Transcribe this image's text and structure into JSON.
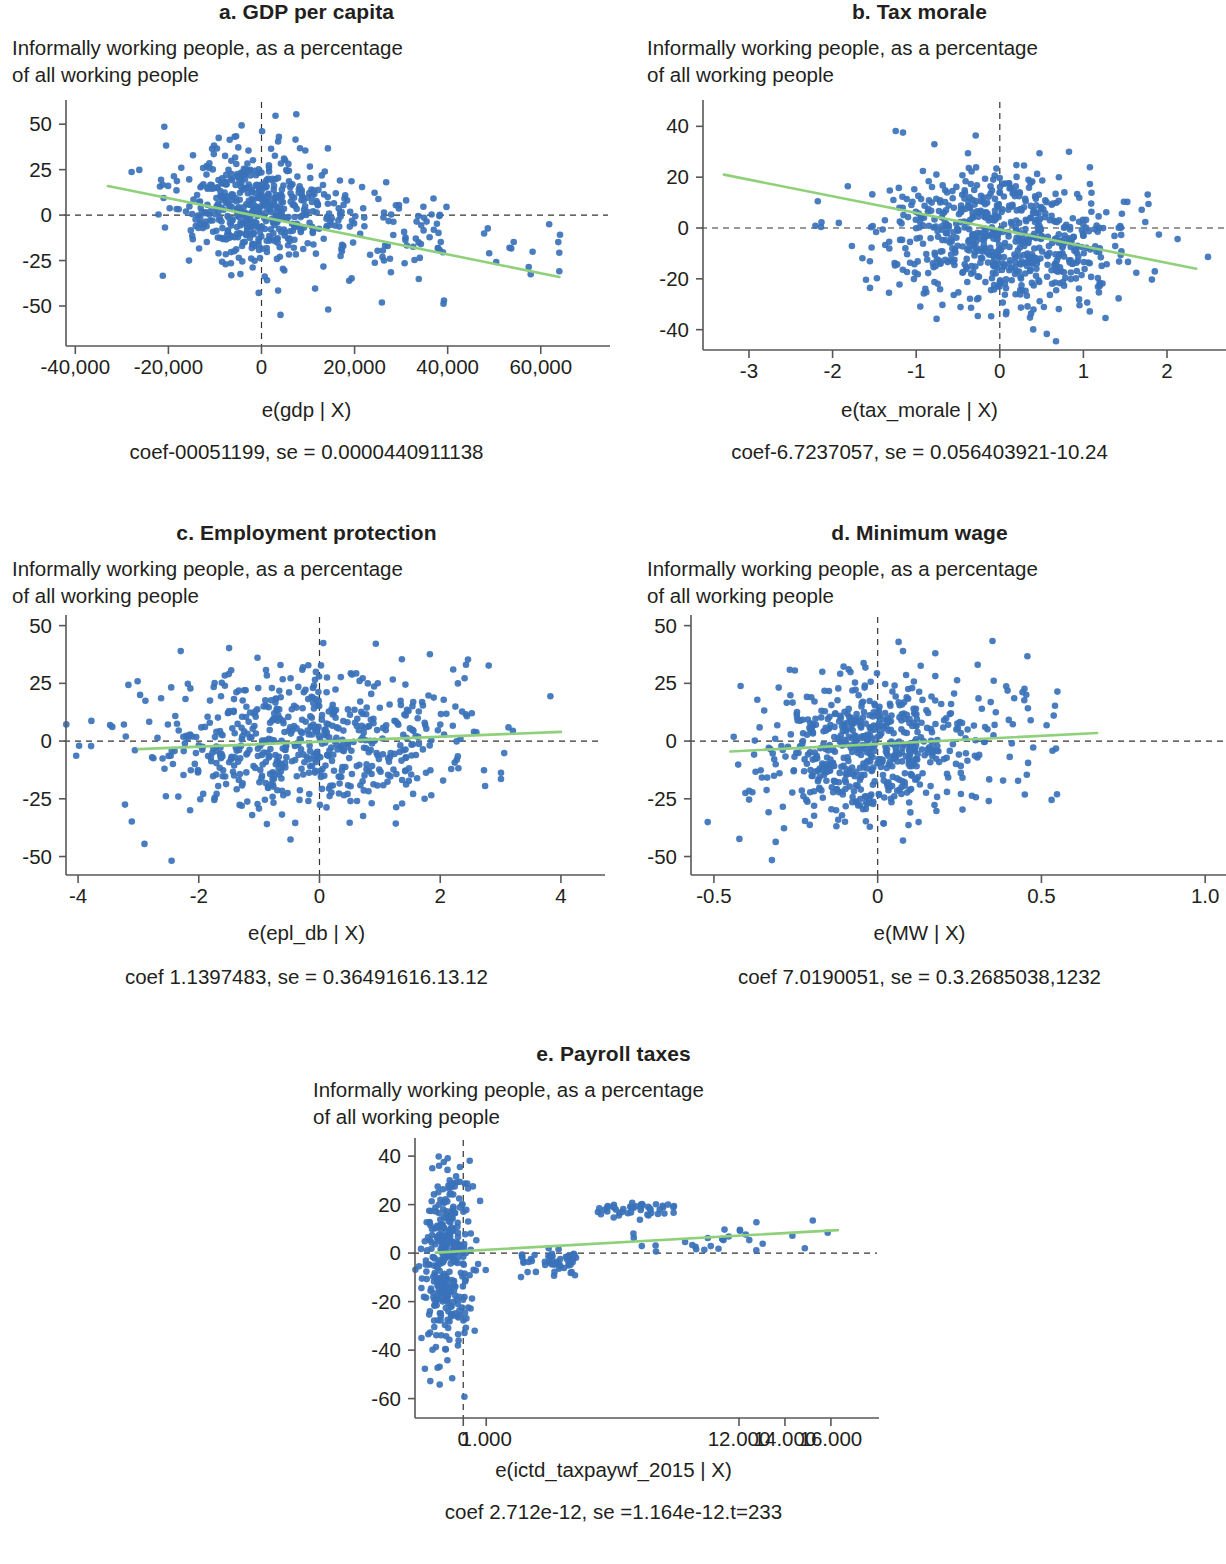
{
  "figure": {
    "subtitle_line1": "Informally working people, as a percentage",
    "subtitle_line2": "of all working people",
    "colors": {
      "point": "#3a72ba",
      "fit_line": "#8fd17a",
      "axis": "#595757",
      "text": "#231f20"
    }
  },
  "panels": [
    {
      "id": "a",
      "title": "a. GDP per capita",
      "subtitle_line1": "Informally working people, as a percentage",
      "subtitle_line2": "of all working people",
      "xlabel": "e(gdp | X)",
      "coef_text": "coef-00051199, se = 0.0000440911138"
    },
    {
      "id": "b",
      "title": "b. Tax morale",
      "subtitle_line1": "Informally working people, as a percentage",
      "subtitle_line2": "of all working people",
      "xlabel": "e(tax_morale | X)",
      "coef_text": "coef-6.7237057, se = 0.056403921-10.24"
    },
    {
      "id": "c",
      "title": "c. Employment protection",
      "subtitle_line1": "Informally working people, as a percentage",
      "subtitle_line2": "of all working people",
      "xlabel": "e(epl_db | X)",
      "coef_text": "coef 1.1397483, se = 0.36491616.13.12"
    },
    {
      "id": "d",
      "title": "d. Minimum wage",
      "subtitle_line1": "Informally working people, as a percentage",
      "subtitle_line2": "of all working people",
      "xlabel": "e(MW | X)",
      "coef_text": "coef 7.0190051, se = 0.3.2685038,1232"
    },
    {
      "id": "e",
      "title": "e. Payroll taxes",
      "subtitle_line1": "Informally working people, as a percentage",
      "subtitle_line2": "of all working people",
      "xlabel": "e(ictd_taxpaywf_2015 | X)",
      "coef_text": "coef 2.712e-12, se =1.164e-12.t=233"
    }
  ],
  "chart_data": [
    {
      "panel": "a",
      "type": "scatter",
      "title": "a. GDP per capita",
      "ylabel": "Informally working people, as a percentage of all working people",
      "xlabel": "e(gdp | X)",
      "xticks": [
        -40000,
        -20000,
        0,
        20000,
        40000,
        60000
      ],
      "xticklabels": [
        "-40,000",
        "-20,000",
        "0",
        "20,000",
        "40,000",
        "60,000"
      ],
      "yticks": [
        -50,
        -25,
        0,
        25,
        50
      ],
      "yticklabels": [
        "-50",
        "-25",
        "0",
        "25",
        "50"
      ],
      "xlim": [
        -42000,
        68000
      ],
      "ylim": [
        -72,
        60
      ],
      "grid": false,
      "legend": null,
      "n_points": 620,
      "cluster": {
        "cx": -1000,
        "cy": 0,
        "sx": 8500,
        "sy": 17
      },
      "fit_line": {
        "x0": -33000,
        "y0": 16,
        "x1": 64000,
        "y1": -34
      },
      "zero_line_h": 0,
      "zero_line_v": 0,
      "annotation": "coef-00051199, se = 0.0000440911138"
    },
    {
      "panel": "b",
      "type": "scatter",
      "title": "b. Tax morale",
      "ylabel": "Informally working people, as a percentage of all working people",
      "xlabel": "e(tax_morale | X)",
      "xticks": [
        -3,
        -2,
        -1,
        0,
        1,
        2
      ],
      "xticklabels": [
        "-3",
        "-2",
        "-1",
        "0",
        "1",
        "2"
      ],
      "yticks": [
        -40,
        -20,
        0,
        20,
        40
      ],
      "yticklabels": [
        "-40",
        "-20",
        "0",
        "20",
        "40"
      ],
      "xlim": [
        -3.55,
        2.55
      ],
      "ylim": [
        -48,
        48
      ],
      "grid": false,
      "legend": null,
      "n_points": 700,
      "cluster": {
        "cx": 0.05,
        "cy": -2,
        "sx": 0.75,
        "sy": 14
      },
      "fit_line": {
        "x0": -3.3,
        "y0": 21,
        "x1": 2.35,
        "y1": -16
      },
      "zero_line_h": 0,
      "zero_line_v": 0,
      "annotation": "coef-6.7237057, se = 0.056403921-10.24"
    },
    {
      "panel": "c",
      "type": "scatter",
      "title": "c. Employment protection",
      "ylabel": "Informally working people, as a percentage of all working people",
      "xlabel": "e(epl_db | X)",
      "xticks": [
        -4,
        -2,
        0,
        2,
        4
      ],
      "xticklabels": [
        "-4",
        "-2",
        "0",
        "2",
        "4"
      ],
      "yticks": [
        -50,
        -25,
        0,
        25,
        50
      ],
      "yticklabels": [
        "-50",
        "-25",
        "0",
        "25",
        "50"
      ],
      "xlim": [
        -4.2,
        4.2
      ],
      "ylim": [
        -58,
        52
      ],
      "grid": false,
      "legend": null,
      "n_points": 620,
      "cluster": {
        "cx": -0.25,
        "cy": 0,
        "sx": 1.45,
        "sy": 15
      },
      "fit_line": {
        "x0": -3.0,
        "y0": -3.5,
        "x1": 4.0,
        "y1": 4.0
      },
      "zero_line_h": 0,
      "zero_line_v": 0,
      "annotation": "coef 1.1397483, se = 0.36491616.13.12"
    },
    {
      "panel": "d",
      "type": "scatter",
      "title": "d. Minimum wage",
      "ylabel": "Informally working people, as a percentage of all working people",
      "xlabel": "e(MW | X)",
      "xticks": [
        -0.5,
        0,
        0.5,
        1.0
      ],
      "xticklabels": [
        "-0.5",
        "0",
        "0.5",
        "1.0"
      ],
      "yticks": [
        -50,
        -25,
        0,
        25,
        50
      ],
      "yticklabels": [
        "-50",
        "-25",
        "0",
        "25",
        "50"
      ],
      "xlim": [
        -0.57,
        1.03
      ],
      "ylim": [
        -58,
        52
      ],
      "grid": false,
      "legend": null,
      "n_points": 640,
      "cluster": {
        "cx": -0.04,
        "cy": -2,
        "sx": 0.145,
        "sy": 15
      },
      "fit_line": {
        "x0": -0.45,
        "y0": -4.5,
        "x1": 0.67,
        "y1": 3.5
      },
      "zero_line_h": 0,
      "zero_line_v": 0,
      "annotation": "coef 7.0190051, se = 0.3.2685038,1232"
    },
    {
      "panel": "e",
      "type": "scatter",
      "title": "e. Payroll taxes",
      "ylabel": "Informally working people, as a percentage of all working people",
      "xlabel": "e(ictd_taxpaywf_2015 | X)",
      "xticks": [
        0,
        1000,
        12000,
        14000,
        16000
      ],
      "xticklabels": [
        "0",
        "1.000",
        "12.000",
        "14.000",
        "16.000"
      ],
      "yticks": [
        -60,
        -40,
        -20,
        0,
        20,
        40
      ],
      "yticklabels": [
        "-60",
        "-40",
        "-20",
        "0",
        "20",
        "40"
      ],
      "xlim": [
        -2100,
        16700
      ],
      "ylim": [
        -68,
        45
      ],
      "grid": false,
      "legend": null,
      "n_points": 470,
      "cluster": {
        "cx": -700,
        "cy": 0,
        "sx": 520,
        "sy": 17
      },
      "fit_line": {
        "x0": -1200,
        "y0": 0.2,
        "x1": 16300,
        "y1": 9.5
      },
      "zero_line_h": 0,
      "zero_line_v": 0,
      "annotation": "coef 2.712e-12, se =1.164e-12.t=233"
    }
  ]
}
